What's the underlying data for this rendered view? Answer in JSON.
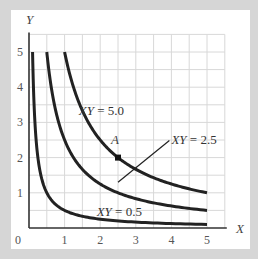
{
  "chart_data": {
    "type": "line",
    "title": "",
    "xlabel": "X",
    "ylabel": "Y",
    "xlim": [
      0,
      5.5
    ],
    "ylim": [
      0,
      5.5
    ],
    "grid": true,
    "grid_step": 0.5,
    "x_ticks": [
      "0",
      "1",
      "2",
      "3",
      "4",
      "5"
    ],
    "y_ticks": [
      "1",
      "2",
      "3",
      "4",
      "5"
    ],
    "series": [
      {
        "name": "XY = 0.5",
        "k": 0.5,
        "x_range": [
          0.1,
          5
        ]
      },
      {
        "name": "XY = 2.5",
        "k": 2.5,
        "x_range": [
          0.5,
          5
        ]
      },
      {
        "name": "XY = 5.0",
        "k": 5.0,
        "x_range": [
          1,
          5
        ]
      }
    ],
    "points": [
      {
        "label": "A",
        "x": 2.5,
        "y": 2.0
      }
    ],
    "annotations": [
      {
        "text": "XY = 5.0",
        "x": 1.4,
        "y": 3.2
      },
      {
        "text": "XY = 2.5",
        "x": 4.0,
        "y": 2.4,
        "leader_from": [
          2.5,
          1.3
        ]
      },
      {
        "text": "XY = 0.5",
        "x": 1.9,
        "y": 0.35
      },
      {
        "text": "A",
        "x": 2.3,
        "y": 2.4
      }
    ]
  }
}
